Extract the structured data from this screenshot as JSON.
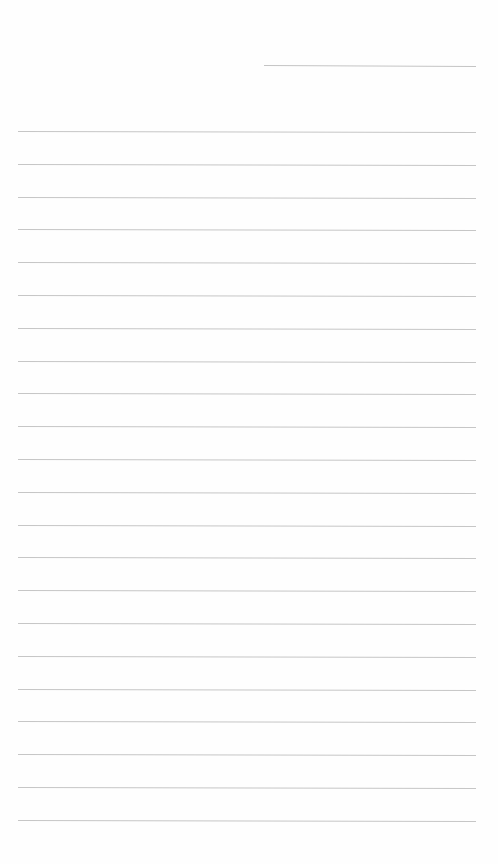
{
  "page": {
    "type": "blank ruled sheet",
    "background_color": "#fefefe",
    "line_color": "#c6c6c6",
    "header_line": {
      "present": true,
      "position": "top-right",
      "text": ""
    },
    "ruled_lines": {
      "count": 22,
      "first_y": 131,
      "spacing": 32.8,
      "text_entries": [
        "",
        "",
        "",
        "",
        "",
        "",
        "",
        "",
        "",
        "",
        "",
        "",
        "",
        "",
        "",
        "",
        "",
        "",
        "",
        "",
        "",
        ""
      ]
    }
  }
}
